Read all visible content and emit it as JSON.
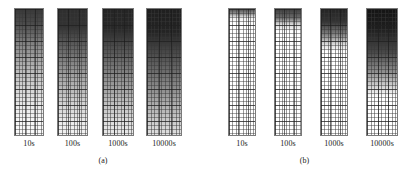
{
  "figure": {
    "background_color": "#ffffff",
    "grid_line_color": "#3c3c3c",
    "plume_color": "#000000",
    "subfigures": [
      {
        "caption": "(a)",
        "caption_top_px": 156,
        "left_px": 4,
        "width_px": 198,
        "panels_left_px": 10,
        "panels_top_px": 8,
        "panels": [
          {
            "label": "10s",
            "left_px": 4,
            "width_px": 30,
            "height_px": 128,
            "cols": 8,
            "rows": 32,
            "front_depth_pct": 100,
            "top_intensity": 0.78,
            "bottom_intensity": 0.02,
            "gradient_stops": [
              {
                "pos_pct": 0,
                "intensity": 0.78
              },
              {
                "pos_pct": 12,
                "intensity": 0.7
              },
              {
                "pos_pct": 30,
                "intensity": 0.46
              },
              {
                "pos_pct": 50,
                "intensity": 0.26
              },
              {
                "pos_pct": 70,
                "intensity": 0.12
              },
              {
                "pos_pct": 88,
                "intensity": 0.04
              },
              {
                "pos_pct": 100,
                "intensity": 0.02
              }
            ]
          },
          {
            "label": "100s",
            "left_px": 47,
            "width_px": 31,
            "height_px": 128,
            "cols": 8,
            "rows": 32,
            "front_depth_pct": 100,
            "top_intensity": 0.84,
            "bottom_intensity": 0.05,
            "gradient_stops": [
              {
                "pos_pct": 0,
                "intensity": 0.82
              },
              {
                "pos_pct": 14,
                "intensity": 0.8
              },
              {
                "pos_pct": 32,
                "intensity": 0.6
              },
              {
                "pos_pct": 52,
                "intensity": 0.38
              },
              {
                "pos_pct": 72,
                "intensity": 0.2
              },
              {
                "pos_pct": 90,
                "intensity": 0.08
              },
              {
                "pos_pct": 100,
                "intensity": 0.05
              }
            ]
          },
          {
            "label": "1000s",
            "left_px": 92,
            "width_px": 32,
            "height_px": 128,
            "cols": 9,
            "rows": 32,
            "front_depth_pct": 100,
            "top_intensity": 0.88,
            "bottom_intensity": 0.08,
            "gradient_stops": [
              {
                "pos_pct": 0,
                "intensity": 0.86
              },
              {
                "pos_pct": 16,
                "intensity": 0.84
              },
              {
                "pos_pct": 34,
                "intensity": 0.66
              },
              {
                "pos_pct": 54,
                "intensity": 0.46
              },
              {
                "pos_pct": 74,
                "intensity": 0.26
              },
              {
                "pos_pct": 92,
                "intensity": 0.12
              },
              {
                "pos_pct": 100,
                "intensity": 0.08
              }
            ]
          },
          {
            "label": "10000s",
            "left_px": 136,
            "width_px": 36,
            "height_px": 128,
            "cols": 10,
            "rows": 32,
            "front_depth_pct": 100,
            "top_intensity": 0.9,
            "bottom_intensity": 0.12,
            "gradient_stops": [
              {
                "pos_pct": 0,
                "intensity": 0.88
              },
              {
                "pos_pct": 18,
                "intensity": 0.86
              },
              {
                "pos_pct": 36,
                "intensity": 0.7
              },
              {
                "pos_pct": 56,
                "intensity": 0.52
              },
              {
                "pos_pct": 76,
                "intensity": 0.32
              },
              {
                "pos_pct": 94,
                "intensity": 0.16
              },
              {
                "pos_pct": 100,
                "intensity": 0.12
              }
            ]
          }
        ]
      },
      {
        "caption": "(b)",
        "caption_top_px": 156,
        "left_px": 206,
        "width_px": 197,
        "panels_left_px": 22,
        "panels_top_px": 8,
        "panels": [
          {
            "label": "10s",
            "left_px": 4,
            "width_px": 28,
            "height_px": 128,
            "cols": 8,
            "rows": 32,
            "front_depth_pct": 6,
            "top_intensity": 0.7,
            "bottom_intensity": 0.0,
            "gradient_stops": [
              {
                "pos_pct": 0,
                "intensity": 0.7
              },
              {
                "pos_pct": 4,
                "intensity": 0.4
              },
              {
                "pos_pct": 7,
                "intensity": 0.06
              },
              {
                "pos_pct": 12,
                "intensity": 0.0
              },
              {
                "pos_pct": 100,
                "intensity": 0.0
              }
            ]
          },
          {
            "label": "100s",
            "left_px": 50,
            "width_px": 28,
            "height_px": 128,
            "cols": 8,
            "rows": 32,
            "front_depth_pct": 12,
            "top_intensity": 0.76,
            "bottom_intensity": 0.0,
            "gradient_stops": [
              {
                "pos_pct": 0,
                "intensity": 0.76
              },
              {
                "pos_pct": 7,
                "intensity": 0.58
              },
              {
                "pos_pct": 12,
                "intensity": 0.16
              },
              {
                "pos_pct": 18,
                "intensity": 0.0
              },
              {
                "pos_pct": 100,
                "intensity": 0.0
              }
            ]
          },
          {
            "label": "1000s",
            "left_px": 96,
            "width_px": 28,
            "height_px": 128,
            "cols": 8,
            "rows": 32,
            "front_depth_pct": 28,
            "top_intensity": 0.86,
            "bottom_intensity": 0.0,
            "gradient_stops": [
              {
                "pos_pct": 0,
                "intensity": 0.86
              },
              {
                "pos_pct": 10,
                "intensity": 0.8
              },
              {
                "pos_pct": 20,
                "intensity": 0.5
              },
              {
                "pos_pct": 28,
                "intensity": 0.14
              },
              {
                "pos_pct": 34,
                "intensity": 0.0
              },
              {
                "pos_pct": 100,
                "intensity": 0.0
              }
            ]
          },
          {
            "label": "10000s",
            "left_px": 142,
            "width_px": 32,
            "height_px": 128,
            "cols": 9,
            "rows": 32,
            "front_depth_pct": 64,
            "top_intensity": 0.92,
            "bottom_intensity": 0.0,
            "gradient_stops": [
              {
                "pos_pct": 0,
                "intensity": 0.92
              },
              {
                "pos_pct": 16,
                "intensity": 0.88
              },
              {
                "pos_pct": 34,
                "intensity": 0.72
              },
              {
                "pos_pct": 50,
                "intensity": 0.44
              },
              {
                "pos_pct": 62,
                "intensity": 0.16
              },
              {
                "pos_pct": 70,
                "intensity": 0.0
              },
              {
                "pos_pct": 100,
                "intensity": 0.0
              }
            ]
          }
        ]
      }
    ]
  }
}
